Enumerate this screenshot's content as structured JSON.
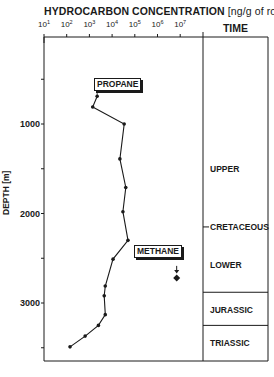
{
  "chart_data": {
    "type": "line",
    "title": "HYDROCARBON CONCENTRATION",
    "title_unit": "[ng/g of rock]",
    "xlabel": "Hydrocarbon concentration (ng/g of rock)",
    "ylabel": "DEPTH [m]",
    "x_scale": "log",
    "x_ticks": [
      {
        "base": "10",
        "exp": "1"
      },
      {
        "base": "10",
        "exp": "2"
      },
      {
        "base": "10",
        "exp": "3"
      },
      {
        "base": "10",
        "exp": "4"
      },
      {
        "base": "10",
        "exp": "5"
      },
      {
        "base": "10",
        "exp": "6"
      },
      {
        "base": "10",
        "exp": "7"
      }
    ],
    "xlim": [
      10,
      10000000
    ],
    "y_ticks": [
      "1000",
      "2000",
      "3000"
    ],
    "ylim": [
      3600,
      -50
    ],
    "y_inverted": true,
    "series": [
      {
        "name": "PROPANE",
        "points": [
          {
            "conc": 2200,
            "depth": 690
          },
          {
            "conc": 1400,
            "depth": 810
          },
          {
            "conc": 34000,
            "depth": 1000
          },
          {
            "conc": 22000,
            "depth": 1390
          },
          {
            "conc": 40000,
            "depth": 1710
          },
          {
            "conc": 30000,
            "depth": 1980
          },
          {
            "conc": 50000,
            "depth": 2300
          },
          {
            "conc": 11000,
            "depth": 2510
          },
          {
            "conc": 5000,
            "depth": 2810
          },
          {
            "conc": 4500,
            "depth": 2920
          },
          {
            "conc": 5000,
            "depth": 3130
          },
          {
            "conc": 2500,
            "depth": 3250
          },
          {
            "conc": 650,
            "depth": 3370
          },
          {
            "conc": 140,
            "depth": 3490
          }
        ]
      },
      {
        "name": "METHANE",
        "points": [
          {
            "conc": 7000000,
            "depth": 2630,
            "marker": "arrow-down"
          },
          {
            "conc": 7000000,
            "depth": 2720,
            "marker": "diamond"
          }
        ]
      }
    ],
    "time_column": {
      "header": "TIME",
      "periods": [
        {
          "label": "UPPER",
          "depth_center": 1500
        },
        {
          "label": "CRETACEOUS",
          "depth_center": 2150
        },
        {
          "label": "LOWER",
          "depth_center": 2580
        },
        {
          "label": "JURASSIC",
          "depth_center": 3080
        },
        {
          "label": "TRIASSIC",
          "depth_center": 3450
        }
      ],
      "boundaries_depth": [
        2880,
        3250
      ]
    },
    "annotations": [
      "PROPANE",
      "METHANE"
    ],
    "grid": false
  },
  "labels": {
    "title": "HYDROCARBON  CONCENTRATION",
    "unit": "[ng/g of rock]",
    "time_header": "TIME",
    "ylabel": "DEPTH [m]",
    "propane": "PROPANE",
    "methane": "METHANE"
  },
  "colors": {
    "ink": "#1a1a1a",
    "background": "#ffffff"
  }
}
